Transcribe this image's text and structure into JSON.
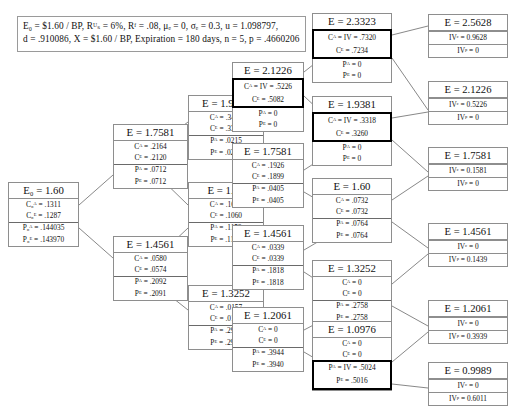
{
  "header": {
    "line1": "E₀ = $1.60 / BP,  Rᵁₛ = 6%,  Rᶠ = .08,  μₑ = 0,  σₑ = 0.3,  u = 1.098797,",
    "line2": "d = .910086,   X = $1.60 / BP,   Expiration = 180 days,  n = 5,  p = .4660206",
    "params": {
      "E0": "$1.60/BP",
      "R_US_A": "6%",
      "R_F_A": ".08",
      "mu_e_A": "0",
      "sigma_e_A": "0.3",
      "u": "1.098797",
      "d": ".910086",
      "X": "$1.60/BP",
      "expiration": "180 days",
      "n": "5",
      "p": ".4660206"
    }
  },
  "labels": {
    "E": "E",
    "E0": "E₀",
    "CA": "Cᴬ",
    "CE": "Cᴱ",
    "PA": "Pᴬ",
    "PE": "Pᴱ",
    "C0A": "C₀ᴬ",
    "C0E": "C₀ᴱ",
    "P0A": "P₀ᴬ",
    "P0E": "P₀ᴱ",
    "IVC": "IVᶜ",
    "IVP": "IVᵖ"
  },
  "nodes": {
    "n0": {
      "title": "E₀ = 1.60",
      "r1": "C₀ᴬ = .1311",
      "r2": "C₀ᴱ = .1287",
      "r3": "P₀ᴬ = .144035",
      "r4": "P₀ᴱ = .143970"
    },
    "n1u": {
      "title": "E = 1.7581",
      "r1": "Cᴬ = .2164",
      "r2": "Cᴱ = .2120",
      "r3": "Pᴬ = .0712",
      "r4": "Pᴱ = .0712"
    },
    "n1d": {
      "title": "E = 1.4561",
      "r1": "Cᴬ = .0580",
      "r2": "Cᴱ = .0574",
      "r3": "Pᴬ = .2092",
      "r4": "Pᴱ = .2091"
    },
    "n2uu": {
      "title": "E = 1.9381",
      "r1": "Cᴬ = .3443",
      "r2": "Cᴱ = .3363",
      "r3": "Pᴬ = .0215",
      "r4": "Pᴱ = .0215"
    },
    "n2ud": {
      "title": "E = 1.60",
      "r1": "Cᴬ = .1072",
      "r2": "Cᴱ = .1060",
      "r3": "Pᴬ = .1153",
      "r4": "Pᴱ = .1153"
    },
    "n2dd": {
      "title": "E = 1.3252",
      "r1": "Cᴬ = .0157",
      "r2": "Cᴱ = .0157",
      "r3": "Pᴬ = .2936",
      "r4": "Pᴱ = .2934"
    },
    "n3a": {
      "title": "E = 2.1226",
      "r1": "Cᴬ = IV = .5226",
      "r2": "Cᴱ = .5082",
      "r3": "Pᴬ = 0",
      "r4": "Pᴱ = 0",
      "highlight": "first"
    },
    "n3b": {
      "title": "E = 1.7581",
      "r1": "Cᴬ = .1926",
      "r2": "Cᴱ = .1899",
      "r3": "Pᴬ = .0405",
      "r4": "Pᴱ = .0405"
    },
    "n3c": {
      "title": "E = 1.4561",
      "r1": "Cᴬ = .0339",
      "r2": "Cᴱ = .0339",
      "r3": "Pᴬ = .1818",
      "r4": "Pᴱ = .1818"
    },
    "n3d": {
      "title": "E = 1.2061",
      "r1": "Cᴬ = 0",
      "r2": "Cᴱ = 0",
      "r3": "Pᴬ = .3944",
      "r4": "Pᴱ = .3940"
    },
    "n4a": {
      "title": "E = 2.3323",
      "r1": "Cᴬ = IV = .7320",
      "r2": "Cᴱ = .7234",
      "r3": "Pᴬ = 0",
      "r4": "Pᴱ = 0",
      "highlight": "first"
    },
    "n4b": {
      "title": "E = 1.9381",
      "r1": "Cᴬ = IV = .3318",
      "r2": "Cᴱ = .3260",
      "r3": "Pᴬ = 0",
      "r4": "Pᴱ = 0",
      "highlight": "first"
    },
    "n4c": {
      "title": "E = 1.60",
      "r1": "Cᴬ = .0732",
      "r2": "Cᴱ = .0732",
      "r3": "Pᴬ = .0764",
      "r4": "Pᴱ = .0764"
    },
    "n4d": {
      "title": "E = 1.3252",
      "r1": "Cᴬ = 0",
      "r2": "Cᴱ = 0",
      "r3": "Pᴬ = .2758",
      "r4": "Pᴱ = .2758"
    },
    "n4e": {
      "title": "E = 1.0976",
      "r1": "Cᴬ = 0",
      "r2": "Cᴱ = 0",
      "r3": "Pᴬ = IV = .5024",
      "r4": "Pᴱ = .5016",
      "highlight": "second"
    },
    "t1": {
      "title": "E = 2.5628",
      "r1": "IVᶜ = 0.9628",
      "r2": "IVᵖ = 0"
    },
    "t2": {
      "title": "E = 2.1226",
      "r1": "IVᶜ = 0.5226",
      "r2": "IVᵖ = 0"
    },
    "t3": {
      "title": "E = 1.7581",
      "r1": "IVᶜ = 0.1581",
      "r2": "IVᵖ = 0"
    },
    "t4": {
      "title": "E = 1.4561",
      "r1": "IVᶜ = 0",
      "r2": "IVᵖ = 0.1439"
    },
    "t5": {
      "title": "E = 1.2061",
      "r1": "IVᶜ = 0",
      "r2": "IVᵖ = 0.3939"
    },
    "t6": {
      "title": "E = 0.9989",
      "r1": "IVᶜ = 0",
      "r2": "IVᵖ = 0.6011"
    }
  },
  "colors": {
    "border": "#8e8e8e",
    "highlight": "#000000",
    "background": "#ffffff",
    "edge": "#555555"
  }
}
